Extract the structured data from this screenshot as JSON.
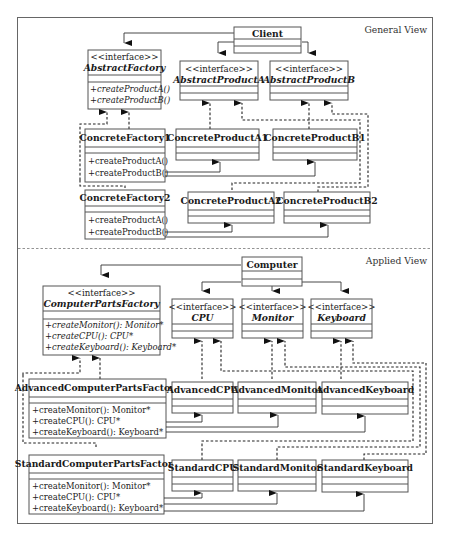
{
  "general_view": {
    "label": "General View",
    "classes": {
      "client": {
        "name": "Client"
      },
      "abstract_factory": {
        "stereotype": "<<interface>>",
        "name": "AbstractFactory",
        "methods": [
          "+createProductA()",
          "+createProductB()"
        ]
      },
      "abstract_product_a": {
        "stereotype": "<<interface>>",
        "name": "AbstractProductA"
      },
      "abstract_product_b": {
        "stereotype": "<<interface>>",
        "name": "AbstractProductB"
      },
      "concrete_factory_1": {
        "name": "ConcreteFactory1",
        "methods": [
          "+createProductA()",
          "+createProductB()"
        ]
      },
      "concrete_factory_2": {
        "name": "ConcreteFactory2",
        "methods": [
          "+createProductA()",
          "+createProductB()"
        ]
      },
      "concrete_product_a1": {
        "name": "ConcreteProductA1"
      },
      "concrete_product_b1": {
        "name": "ConcreteProductB1"
      },
      "concrete_product_a2": {
        "name": "ConcreteProductA2"
      },
      "concrete_product_b2": {
        "name": "ConcreteProductB2"
      }
    }
  },
  "applied_view": {
    "label": "Applied View",
    "classes": {
      "computer": {
        "name": "Computer"
      },
      "computer_parts_factory": {
        "stereotype": "<<interface>>",
        "name": "ComputerPartsFactory",
        "methods": [
          "+createMonitor(): Monitor*",
          "+createCPU(): CPU*",
          "+createKeyboard(): Keyboard*"
        ]
      },
      "cpu": {
        "stereotype": "<<interface>>",
        "name": "CPU"
      },
      "monitor": {
        "stereotype": "<<interface>>",
        "name": "Monitor"
      },
      "keyboard": {
        "stereotype": "<<interface>>",
        "name": "Keyboard"
      },
      "advanced_factory": {
        "name": "AdvancedComputerPartsFactory",
        "methods": [
          "+createMonitor(): Monitor*",
          "+createCPU(): CPU*",
          "+createKeyboard(): Keyboard*"
        ]
      },
      "standard_factory": {
        "name": "StandardComputerPartsFactory",
        "methods": [
          "+createMonitor(): Monitor*",
          "+createCPU(): CPU*",
          "+createKeyboard(): Keyboard*"
        ]
      },
      "advanced_cpu": {
        "name": "AdvancedCPU"
      },
      "advanced_monitor": {
        "name": "AdvancedMonitor"
      },
      "advanced_keyboard": {
        "name": "AdvancedKeyboard"
      },
      "standard_cpu": {
        "name": "StandardCPU"
      },
      "standard_monitor": {
        "name": "StandardMonitor"
      },
      "standard_keyboard": {
        "name": "StandardKeyboard"
      }
    }
  }
}
